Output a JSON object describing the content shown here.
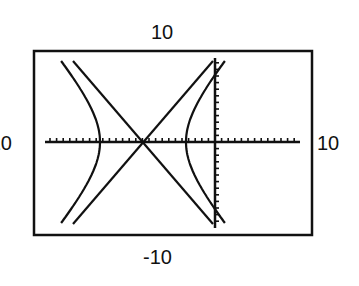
{
  "chart_data": {
    "type": "line",
    "title": "",
    "window_labels": {
      "ymax": "10",
      "ymin": "-10",
      "xmin": "-10",
      "xmax": "10"
    },
    "axis_tick_spacing": 1,
    "grid": false,
    "series": [
      {
        "name": "hyperbola",
        "center": [
          -11,
          0
        ],
        "a": 6.5,
        "b": 7.5,
        "orientation": "horizontal"
      },
      {
        "name": "asymptote-1",
        "slope": 1.16,
        "through": [
          -11,
          0
        ]
      },
      {
        "name": "asymptote-2",
        "slope": -1.16,
        "through": [
          -11,
          0
        ]
      }
    ]
  },
  "labels": {
    "top": "10",
    "bottom": "-10",
    "right": "10",
    "left": "-10"
  },
  "colors": {
    "ink": "#111111",
    "background": "#ffffff"
  }
}
